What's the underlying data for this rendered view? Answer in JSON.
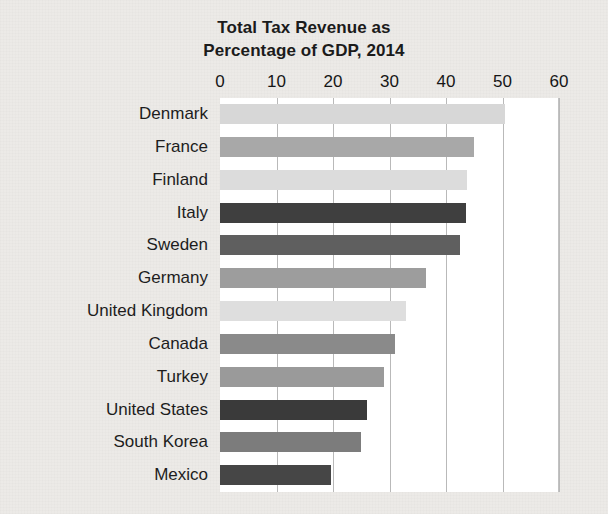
{
  "chart_data": {
    "type": "bar",
    "orientation": "horizontal",
    "title": "Total Tax Revenue as Percentage of GDP, 2014",
    "title_lines": [
      "Total Tax Revenue as",
      "Percentage of GDP, 2014"
    ],
    "xlabel": "",
    "ylabel": "",
    "xlim": [
      0,
      60
    ],
    "xticks": [
      0,
      10,
      20,
      30,
      40,
      50,
      60
    ],
    "xtick_labels": [
      "0",
      "10",
      "20",
      "30",
      "40",
      "50",
      "60"
    ],
    "grid": true,
    "grid_axis": "x",
    "legend": false,
    "categories": [
      "Denmark",
      "France",
      "Finland",
      "Italy",
      "Sweden",
      "Germany",
      "United Kingdom",
      "Canada",
      "Turkey",
      "United States",
      "South Korea",
      "Mexico"
    ],
    "values": [
      50.5,
      45.0,
      43.8,
      43.5,
      42.5,
      36.5,
      33.0,
      31.0,
      29.0,
      26.0,
      25.0,
      19.7
    ],
    "bar_colors": [
      "#d7d7d7",
      "#a8a8a8",
      "#dcdcdc",
      "#3f3f3f",
      "#5f5f5f",
      "#9d9d9d",
      "#dedede",
      "#8a8a8a",
      "#9a9a9a",
      "#3a3a3a",
      "#7c7c7c",
      "#464646"
    ]
  },
  "style": {
    "page_background": "#eceae7",
    "plot_background": "#ffffff",
    "gridline_color": "#b9b9b9",
    "text_color": "#1b1b1b"
  }
}
